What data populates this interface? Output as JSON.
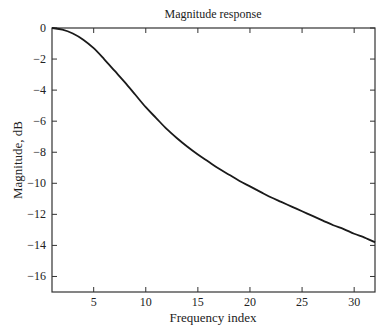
{
  "chart_data": {
    "type": "line",
    "title": "Magnitude response",
    "xlabel": "Frequency index",
    "ylabel": "Magnitude, dB",
    "xlim": [
      1,
      32
    ],
    "ylim": [
      -17,
      0
    ],
    "xticks": [
      5,
      10,
      15,
      20,
      25,
      30
    ],
    "xtick_labels": [
      "5",
      "10",
      "15",
      "20",
      "25",
      "30"
    ],
    "yticks": [
      0,
      -2,
      -4,
      -6,
      -8,
      -10,
      -12,
      -14,
      -16
    ],
    "ytick_labels": [
      "0",
      "−2",
      "−4",
      "−6",
      "−8",
      "−10",
      "−12",
      "−14",
      "−16"
    ],
    "grid": false,
    "legend": null,
    "series": [
      {
        "name": "Magnitude",
        "color": "#1a1a1a",
        "x": [
          1,
          2,
          3,
          4,
          5,
          6,
          7,
          8,
          9,
          10,
          11,
          12,
          13,
          14,
          15,
          16,
          17,
          18,
          19,
          20,
          21,
          22,
          23,
          24,
          25,
          26,
          27,
          28,
          29,
          30,
          31,
          32
        ],
        "values": [
          0.0,
          -0.1,
          -0.35,
          -0.75,
          -1.3,
          -2.0,
          -2.75,
          -3.5,
          -4.3,
          -5.1,
          -5.8,
          -6.5,
          -7.1,
          -7.65,
          -8.15,
          -8.6,
          -9.05,
          -9.45,
          -9.85,
          -10.2,
          -10.55,
          -10.9,
          -11.2,
          -11.5,
          -11.8,
          -12.1,
          -12.4,
          -12.7,
          -12.95,
          -13.25,
          -13.5,
          -13.8
        ]
      }
    ]
  }
}
